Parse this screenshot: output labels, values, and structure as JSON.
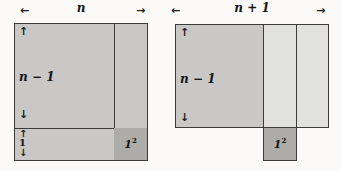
{
  "figures": {
    "left": {
      "width_label": "n",
      "height_label": "n − 1",
      "strip_label": "1",
      "square_label": "1",
      "square_exponent": "2"
    },
    "right": {
      "width_label": "n + 1",
      "height_label": "n − 1",
      "square_label": "1",
      "square_exponent": "2"
    }
  },
  "icons": {
    "arrow_left": "←",
    "arrow_right": "→",
    "arrow_up": "↑",
    "arrow_down": "↓"
  },
  "colors": {
    "background": "#fbfaf8",
    "fill_main": "#c9c8c6",
    "fill_light": "#e1e1df",
    "fill_dark": "#aeaca8",
    "line": "#3c3c3c"
  }
}
